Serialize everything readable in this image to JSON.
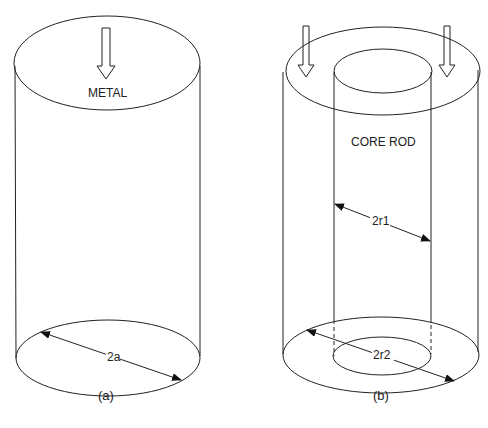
{
  "figure_a": {
    "caption": "(a)",
    "label": "METAL",
    "dimension": "2a"
  },
  "figure_b": {
    "caption": "(b)",
    "label": "CORE ROD",
    "inner_dimension": "2r1",
    "outer_dimension": "2r2"
  }
}
